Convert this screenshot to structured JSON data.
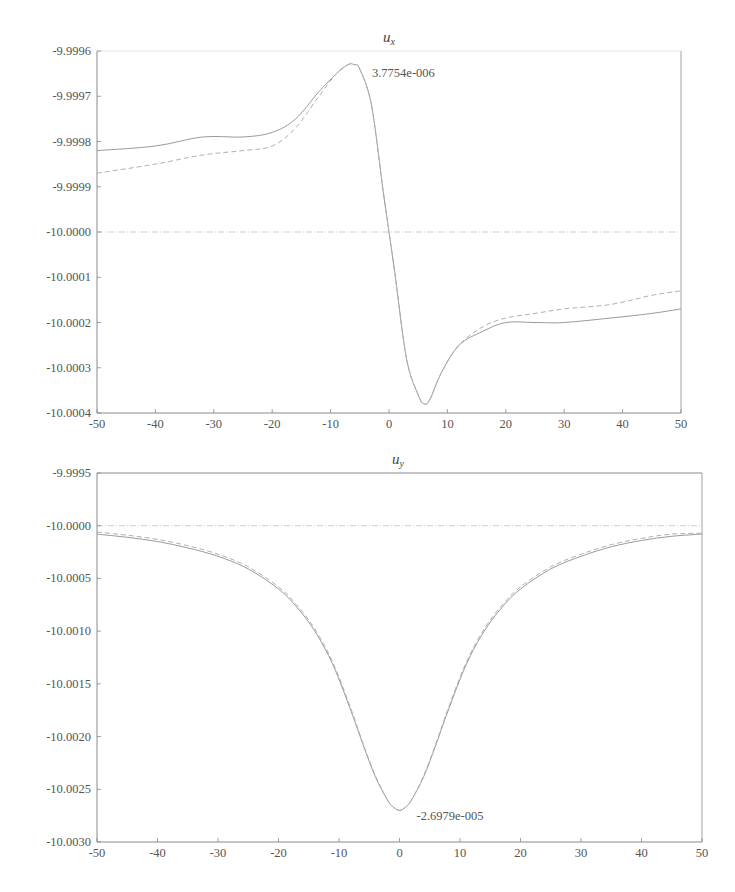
{
  "chart_data": [
    {
      "type": "line",
      "title": "u_x",
      "title_main": "u",
      "title_sub": "x",
      "xlabel": "",
      "ylabel": "",
      "xlim": [
        -50,
        50
      ],
      "ylim": [
        -10.0004,
        -9.9996
      ],
      "x_ticks": [
        "-50",
        "-40",
        "-30",
        "-20",
        "-10",
        "0",
        "10",
        "20",
        "30",
        "40",
        "50"
      ],
      "y_ticks": [
        "-9.9996",
        "-9.9997",
        "-9.9998",
        "-9.9999",
        "-10.0000",
        "-10.0001",
        "-10.0002",
        "-10.0003",
        "-10.0004"
      ],
      "grid": false,
      "reference_line": -10.0,
      "annotation": {
        "text": "3.7754e-006",
        "x": -6,
        "y": -9.99963
      },
      "series": [
        {
          "name": "solid",
          "style": "solid",
          "x": [
            -50,
            -40,
            -32,
            -25,
            -20,
            -16,
            -12,
            -9,
            -7,
            -6,
            -5,
            -3,
            -1,
            0,
            1,
            3,
            5,
            6,
            7,
            9,
            12,
            16,
            20,
            25,
            30,
            38,
            45,
            50
          ],
          "y": [
            -9.99982,
            -9.99981,
            -9.99979,
            -9.99979,
            -9.99978,
            -9.99975,
            -9.99969,
            -9.99965,
            -9.99963,
            -9.99963,
            -9.99964,
            -9.99972,
            -9.99991,
            -10.0,
            -10.00009,
            -10.00028,
            -10.00036,
            -10.00038,
            -10.00037,
            -10.00031,
            -10.00025,
            -10.00022,
            -10.0002,
            -10.0002,
            -10.0002,
            -10.00019,
            -10.00018,
            -10.00017
          ]
        },
        {
          "name": "dashed",
          "style": "dashed",
          "x": [
            -50,
            -40,
            -32,
            -25,
            -20,
            -16,
            -12,
            -9,
            -7,
            -6,
            -5,
            -3,
            -1,
            0,
            1,
            3,
            5,
            6,
            7,
            9,
            12,
            16,
            20,
            25,
            30,
            38,
            45,
            50
          ],
          "y": [
            -9.99987,
            -9.99985,
            -9.99983,
            -9.99982,
            -9.99981,
            -9.99977,
            -9.9997,
            -9.99965,
            -9.99963,
            -9.99963,
            -9.99964,
            -9.99972,
            -9.99991,
            -10.0,
            -10.00009,
            -10.00028,
            -10.00036,
            -10.00038,
            -10.00037,
            -10.00031,
            -10.00025,
            -10.00021,
            -10.00019,
            -10.00018,
            -10.00017,
            -10.00016,
            -10.00014,
            -10.00013
          ]
        }
      ]
    },
    {
      "type": "line",
      "title": "u_y",
      "title_main": "u",
      "title_sub": "y",
      "xlabel": "",
      "ylabel": "",
      "xlim": [
        -50,
        50
      ],
      "ylim": [
        -10.003,
        -9.9995
      ],
      "x_ticks": [
        "-50",
        "-40",
        "-30",
        "-20",
        "-10",
        "0",
        "10",
        "20",
        "30",
        "40",
        "50"
      ],
      "y_ticks": [
        "-9.9995",
        "-10.0000",
        "-10.0005",
        "-10.0010",
        "-10.0015",
        "-10.0020",
        "-10.0025",
        "-10.0030"
      ],
      "grid": false,
      "reference_line": -10.0,
      "annotation": {
        "text": "-2.6979e-005",
        "x": 0,
        "y": -10.0027
      },
      "series": [
        {
          "name": "solid",
          "style": "solid",
          "x": [
            -50,
            -45,
            -40,
            -35,
            -30,
            -25,
            -20,
            -17,
            -14,
            -11,
            -8,
            -6,
            -4,
            -2,
            -1,
            0,
            1,
            2,
            4,
            6,
            8,
            11,
            14,
            17,
            20,
            25,
            30,
            35,
            40,
            45,
            50
          ],
          "y": [
            -10.00008,
            -10.00011,
            -10.00015,
            -10.00021,
            -10.00029,
            -10.00041,
            -10.0006,
            -10.00077,
            -10.001,
            -10.00132,
            -10.00176,
            -10.00208,
            -10.00238,
            -10.0026,
            -10.00267,
            -10.0027,
            -10.00267,
            -10.0026,
            -10.00238,
            -10.00208,
            -10.00176,
            -10.00132,
            -10.001,
            -10.00077,
            -10.0006,
            -10.00041,
            -10.00029,
            -10.0002,
            -10.00014,
            -10.0001,
            -10.00008
          ]
        },
        {
          "name": "dashed",
          "style": "dashed",
          "x": [
            -50,
            -45,
            -40,
            -35,
            -30,
            -25,
            -20,
            -17,
            -14,
            -11,
            -8,
            -6,
            -4,
            -2,
            -1,
            0,
            1,
            2,
            4,
            6,
            8,
            11,
            14,
            17,
            20,
            25,
            30,
            35,
            40,
            45,
            50
          ],
          "y": [
            -10.00006,
            -10.00009,
            -10.00013,
            -10.00019,
            -10.00027,
            -10.00039,
            -10.00058,
            -10.00075,
            -10.00098,
            -10.0013,
            -10.00174,
            -10.00207,
            -10.00237,
            -10.0026,
            -10.00267,
            -10.0027,
            -10.00267,
            -10.0026,
            -10.00237,
            -10.00207,
            -10.00174,
            -10.0013,
            -10.00098,
            -10.00075,
            -10.00058,
            -10.00039,
            -10.00027,
            -10.00018,
            -10.00012,
            -10.00008,
            -10.00007
          ]
        }
      ]
    }
  ],
  "charts": {
    "top": {
      "title_main": "u",
      "title_sub": "x",
      "annotation": "3.7754e-006"
    },
    "bottom": {
      "title_main": "u",
      "title_sub": "y",
      "annotation": "-2.6979e-005"
    }
  },
  "colors": {
    "axis": "#8a8a8a",
    "solid_line": "#9a9a9a",
    "dashed_line": "#b0b0b0",
    "reference_line": "#cfcfcf",
    "text": "#555555"
  }
}
